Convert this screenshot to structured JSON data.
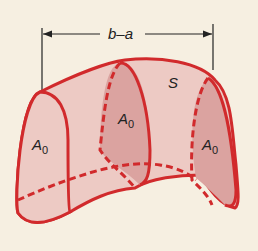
{
  "diagram": {
    "dimension_label": "b–a",
    "surface_label": "S",
    "cross_section_labels": [
      "A₀",
      "A₀",
      "A₀"
    ],
    "cross_section_base": "A",
    "cross_section_sub": "0",
    "colors": {
      "background": "#f6efe1",
      "stroke": "#d12a2c",
      "light_fill": "#edcac4",
      "dark_fill": "#dba3a0",
      "text": "#222222"
    }
  }
}
